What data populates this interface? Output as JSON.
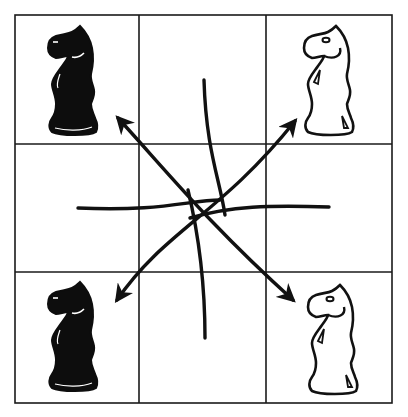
{
  "diagram": {
    "type": "chess-knight-swap-puzzle",
    "grid": {
      "rows": 3,
      "cols": 3,
      "line_color": "#1a1a1a",
      "background": "#ffffff"
    },
    "pieces": [
      {
        "id": "black-knight-top-left",
        "color": "black",
        "piece": "knight",
        "row": 0,
        "col": 0
      },
      {
        "id": "white-knight-top-right",
        "color": "white",
        "piece": "knight",
        "row": 0,
        "col": 2
      },
      {
        "id": "black-knight-bottom-left",
        "color": "black",
        "piece": "knight",
        "row": 2,
        "col": 0
      },
      {
        "id": "white-knight-bottom-right",
        "color": "white",
        "piece": "knight",
        "row": 2,
        "col": 2
      }
    ],
    "curves": [
      {
        "id": "diagonal-arrow-tl-br",
        "arrowheads": "both",
        "from": "top-left",
        "to": "bottom-right"
      },
      {
        "id": "diagonal-arrow-bl-tr",
        "arrowheads": "both",
        "from": "bottom-left",
        "to": "top-right"
      },
      {
        "id": "horizontal-curve",
        "arrowheads": "none"
      },
      {
        "id": "vertical-curve",
        "arrowheads": "none"
      }
    ],
    "ink_color": "#111111"
  }
}
